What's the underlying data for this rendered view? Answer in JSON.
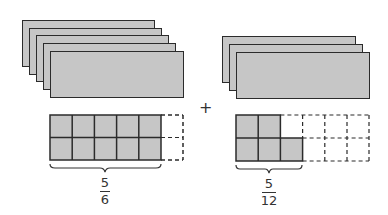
{
  "diagram": {
    "colors": {
      "fill": "#c6c6c6",
      "stroke": "#2b2b2b",
      "text": "#333333"
    },
    "left": {
      "stack_count": 5,
      "grid": {
        "rows": 2,
        "cols": 6,
        "shaded_cells": 10,
        "total_cells": 12
      },
      "fraction": {
        "numerator": "5",
        "denominator": "6"
      }
    },
    "operator": "+",
    "right": {
      "stack_count": 3,
      "grid": {
        "rows": 2,
        "cols": 6,
        "shaded_cells": 5,
        "total_cells": 12
      },
      "fraction": {
        "numerator": "5",
        "denominator": "12"
      }
    }
  }
}
